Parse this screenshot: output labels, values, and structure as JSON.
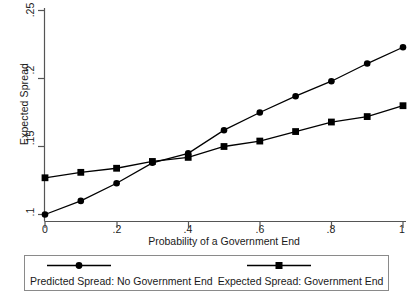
{
  "chart_data": {
    "type": "line",
    "title": "",
    "subtitle": "",
    "xlabel": "Probability of a Government End",
    "ylabel": "Expected Spread",
    "x": [
      0,
      0.1,
      0.2,
      0.3,
      0.4,
      0.5,
      0.6,
      0.7,
      0.8,
      0.9,
      1
    ],
    "xlim": [
      0,
      1
    ],
    "ylim": [
      0.1,
      0.25
    ],
    "xticks": [
      0,
      0.2,
      0.4,
      0.6,
      0.8,
      1
    ],
    "xtick_labels": [
      "0",
      ".2",
      ".4",
      ".6",
      ".8",
      "1"
    ],
    "yticks": [
      0.1,
      0.15,
      0.2,
      0.25
    ],
    "ytick_labels": [
      ".1",
      ".15",
      ".2",
      ".25"
    ],
    "grid": false,
    "legend_position": "bottom",
    "series": [
      {
        "name": "Predicted Spread: No Government End",
        "marker": "circle",
        "color": "#000000",
        "values": [
          0.1,
          0.11,
          0.123,
          0.138,
          0.145,
          0.162,
          0.175,
          0.187,
          0.198,
          0.211,
          0.223
        ]
      },
      {
        "name": "Expected Spread: Government End",
        "marker": "square",
        "color": "#000000",
        "values": [
          0.127,
          0.131,
          0.134,
          0.139,
          0.142,
          0.15,
          0.154,
          0.161,
          0.168,
          0.172,
          0.18
        ]
      }
    ],
    "annotations": []
  },
  "legend": {
    "entries": [
      {
        "label": "Predicted Spread: No Government End",
        "marker": "circle"
      },
      {
        "label": "Expected Spread: Government End",
        "marker": "square"
      }
    ]
  },
  "colors": {
    "line": "#000000",
    "axis": "#555555",
    "text": "#1a1a1a",
    "legend_border": "#8a8a8a",
    "background": "#ffffff"
  }
}
